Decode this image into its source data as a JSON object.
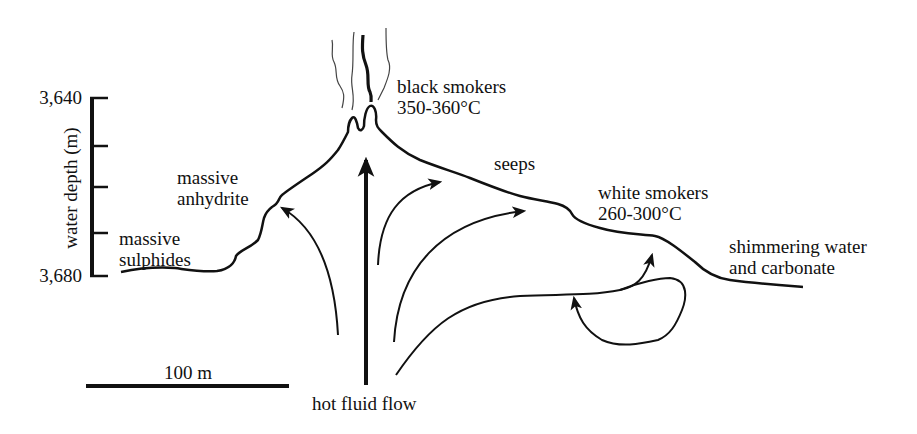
{
  "figure": {
    "type": "cross-section diagram"
  },
  "depth_axis": {
    "label": "water depth (m)",
    "top_tick": "3,640",
    "bottom_tick": "3,680",
    "tick_count": 5
  },
  "scale_bar": {
    "label": "100 m"
  },
  "labels": {
    "black_smokers_line1": "black smokers",
    "black_smokers_line2": "350-360°C",
    "massive_anhydrite_line1": "massive",
    "massive_anhydrite_line2": "anhydrite",
    "massive_sulphides_line1": "massive",
    "massive_sulphides_line2": "sulphides",
    "seeps": "seeps",
    "white_smokers_line1": "white smokers",
    "white_smokers_line2": "260-300°C",
    "shimmering_line1": "shimmering water",
    "shimmering_line2": "and carbonate",
    "hot_fluid_flow": "hot fluid flow"
  },
  "colors": {
    "ink": "#111111",
    "smoke": "#444444",
    "background": "#ffffff"
  }
}
